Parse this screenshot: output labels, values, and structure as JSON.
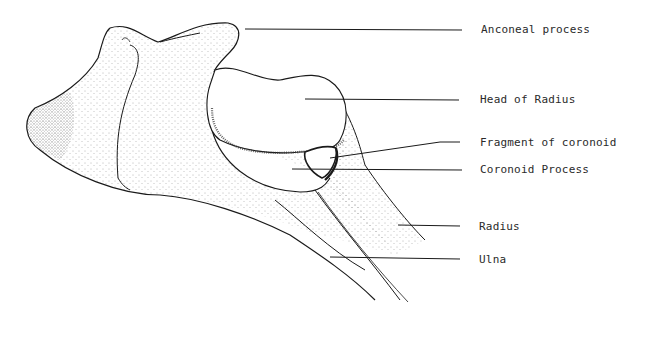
{
  "diagram": {
    "labels": [
      {
        "id": "anconeal",
        "text": "Anconeal process",
        "x": 481,
        "y": 25
      },
      {
        "id": "head-radius",
        "text": "Head of Radius",
        "x": 480,
        "y": 94
      },
      {
        "id": "fragment-coronoid",
        "text": "Fragment of coronoid",
        "x": 480,
        "y": 138
      },
      {
        "id": "coronoid-process",
        "text": "Coronoid Process",
        "x": 480,
        "y": 165
      },
      {
        "id": "radius",
        "text": "Radius",
        "x": 479,
        "y": 221
      },
      {
        "id": "ulna",
        "text": "Ulna",
        "x": 479,
        "y": 254
      }
    ],
    "colors": {
      "ink": "#1a1a1a",
      "stipple": "#555555",
      "background": "#ffffff"
    }
  }
}
